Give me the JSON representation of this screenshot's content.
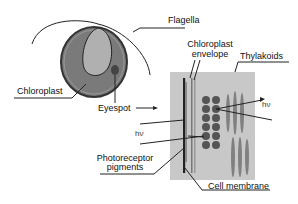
{
  "labels": {
    "flagella": "Flagella",
    "chloroplast": "Chloroplast",
    "eyespot": "Eyespot",
    "chloroplast_envelope_1": "Chloroplast",
    "chloroplast_envelope_2": "envelope",
    "thylakoids": "Thylakoids",
    "hv_right": "hν",
    "hv_left": "hν",
    "photoreceptor_1": "Photoreceptor",
    "photoreceptor_2": "pigments",
    "cell_membrane": "Cell membrane"
  },
  "colors": {
    "cell_outer": "#555555",
    "cell_body": "#7a7a7a",
    "chloroplast_inner": "#b0b0b0",
    "eyespot": "#444444",
    "panel_bg": "#c8c8c8",
    "granule": "#555555",
    "thylakoid": "#808080"
  }
}
